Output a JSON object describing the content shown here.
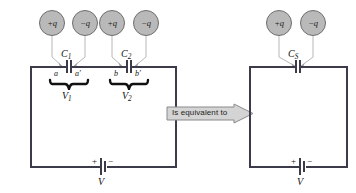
{
  "diagram": {
    "colors": {
      "wire": "#3b3b4a",
      "charge_fill": "#b9b9b9",
      "charge_stroke": "#6e6e6e",
      "leader": "#b0b0b0",
      "banner_fill": "#d4d4d4",
      "banner_stroke": "#8a8a8a",
      "text": "#111111"
    },
    "left_circuit": {
      "name": "series-capacitor-circuit",
      "charges": [
        {
          "id": "charge-1",
          "sign": "+",
          "symbol": "q",
          "label": "+q"
        },
        {
          "id": "charge-2",
          "sign": "−",
          "symbol": "q",
          "label": "−q"
        },
        {
          "id": "charge-3",
          "sign": "+",
          "symbol": "q",
          "label": "+q"
        },
        {
          "id": "charge-4",
          "sign": "−",
          "symbol": "q",
          "label": "−q"
        }
      ],
      "capacitors": [
        {
          "id": "capacitor-1",
          "label": "C",
          "sub": "1",
          "plates": [
            {
              "label": "a"
            },
            {
              "label": "a′"
            }
          ],
          "voltage": {
            "label": "V",
            "sub": "1"
          }
        },
        {
          "id": "capacitor-2",
          "label": "C",
          "sub": "2",
          "plates": [
            {
              "label": "b"
            },
            {
              "label": "b′"
            }
          ],
          "voltage": {
            "label": "V",
            "sub": "2"
          }
        }
      ],
      "battery": {
        "plus": "+",
        "minus": "−",
        "label": "V"
      }
    },
    "right_circuit": {
      "name": "equivalent-capacitor-circuit",
      "charges": [
        {
          "id": "charge-5",
          "sign": "+",
          "symbol": "q",
          "label": "+q"
        },
        {
          "id": "charge-6",
          "sign": "−",
          "symbol": "q",
          "label": "−q"
        }
      ],
      "capacitors": [
        {
          "id": "capacitor-s",
          "label": "C",
          "sub": "S"
        }
      ],
      "battery": {
        "plus": "+",
        "minus": "−",
        "label": "V"
      }
    },
    "connector": {
      "name": "equivalence-arrow",
      "text": "Is equivalent to"
    }
  }
}
